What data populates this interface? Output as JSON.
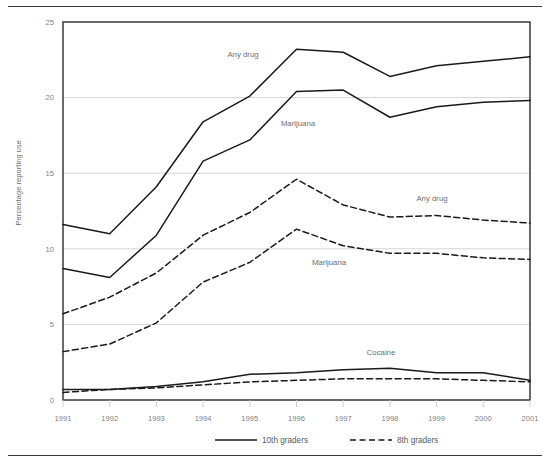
{
  "chart_data": {
    "type": "line",
    "title": "",
    "subtitle": "",
    "xlabel": "",
    "ylabel": "Percentage reporting use",
    "x": [
      1991,
      1992,
      1993,
      1994,
      1995,
      1996,
      1997,
      1998,
      1999,
      2000,
      2001
    ],
    "xticklabels": [
      "1991",
      "1992",
      "1993",
      "1994",
      "1995",
      "1996",
      "1997",
      "1998",
      "1999",
      "2000",
      "2001"
    ],
    "yticklabels": [
      "0",
      "5",
      "10",
      "15",
      "20",
      "25"
    ],
    "yticks": [
      0,
      5,
      10,
      15,
      20,
      25
    ],
    "ylim": [
      0,
      25
    ],
    "xlim": [
      1991,
      2001
    ],
    "grid": "horizontal",
    "legend_position": "bottom",
    "series": [
      {
        "name": "Any drug",
        "grade": "10th graders",
        "style": "solid",
        "label": "Any drug",
        "values": [
          11.6,
          11.0,
          14.1,
          18.4,
          20.1,
          23.2,
          23.0,
          21.4,
          22.1,
          22.4,
          22.7
        ]
      },
      {
        "name": "Marijuana",
        "grade": "10th graders",
        "style": "solid",
        "label": "Marijuana",
        "values": [
          8.7,
          8.1,
          10.9,
          15.8,
          17.2,
          20.4,
          20.5,
          18.7,
          19.4,
          19.7,
          19.8
        ]
      },
      {
        "name": "Any drug",
        "grade": "8th graders",
        "style": "dashed",
        "label": "Any drug",
        "values": [
          5.7,
          6.8,
          8.4,
          10.9,
          12.4,
          14.6,
          12.9,
          12.1,
          12.2,
          11.9,
          11.7
        ]
      },
      {
        "name": "Marijuana",
        "grade": "8th graders",
        "style": "dashed",
        "label": "Marijuana",
        "values": [
          3.2,
          3.7,
          5.1,
          7.8,
          9.1,
          11.3,
          10.2,
          9.7,
          9.7,
          9.4,
          9.3
        ]
      },
      {
        "name": "Cocaine",
        "grade": "10th graders",
        "style": "solid",
        "label": "Cocaine",
        "values": [
          0.7,
          0.7,
          0.9,
          1.2,
          1.7,
          1.8,
          2.0,
          2.1,
          1.8,
          1.8,
          1.3
        ]
      },
      {
        "name": "Cocaine",
        "grade": "8th graders",
        "style": "dashed",
        "label": "",
        "values": [
          0.5,
          0.7,
          0.8,
          1.0,
          1.2,
          1.3,
          1.4,
          1.4,
          1.4,
          1.3,
          1.2
        ]
      }
    ],
    "annotations": [
      {
        "text": "Any drug",
        "series": "Any drug 10th",
        "x_px": 243,
        "y_px": 57
      },
      {
        "text": "Marijuana",
        "series": "Marijuana 10th",
        "x_px": 298,
        "y_px": 126
      },
      {
        "text": "Any drug",
        "series": "Any drug 8th",
        "x_px": 432,
        "y_px": 201
      },
      {
        "text": "Marijuana",
        "series": "Marijuana 8th",
        "x_px": 329,
        "y_px": 265
      },
      {
        "text": "Cocaine",
        "series": "Cocaine",
        "x_px": 381,
        "y_px": 355
      }
    ],
    "legend": [
      {
        "label": "10th graders",
        "style": "solid"
      },
      {
        "label": "8th graders",
        "style": "dashed"
      }
    ],
    "colors": {
      "line": "#1a1a1a",
      "grid": "#c9cacc",
      "axis": "#3a3a3a",
      "tick_text": "#808285",
      "annotation_text": "#6d6e70"
    }
  }
}
